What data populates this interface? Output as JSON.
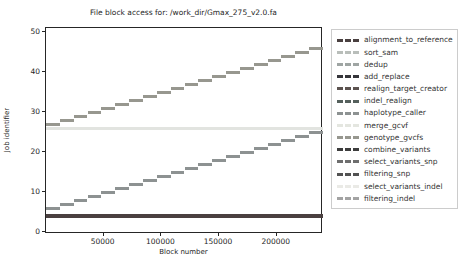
{
  "chart_data": {
    "type": "line",
    "title": "File block access for: /work_dir/Gmax_275_v2.0.fa",
    "xlabel": "Block number",
    "ylabel": "Job identifier",
    "xlim": [
      0,
      240000
    ],
    "ylim": [
      -0.5,
      51
    ],
    "x_ticks": [
      50000,
      100000,
      150000,
      200000
    ],
    "y_ticks": [
      0,
      10,
      20,
      30,
      40,
      50
    ],
    "grid": false,
    "legend_position": "right-outside",
    "series": [
      {
        "name": "alignment_to_reference",
        "color": "#4a4040",
        "segments": [
          {
            "x0": 0,
            "x1": 240000,
            "y": 4,
            "lw": 4
          }
        ]
      },
      {
        "name": "merge_gcvf",
        "color": "#e2e4e0",
        "segments": [
          {
            "x0": 0,
            "x1": 240000,
            "y": 26,
            "lw": 3
          }
        ]
      },
      {
        "name": "haplotype_caller",
        "color": "#8d9292",
        "segments": [
          {
            "x0": 0,
            "x1": 12000,
            "y": 6,
            "lw": 3
          },
          {
            "x0": 12000,
            "x1": 24000,
            "y": 7,
            "lw": 3
          },
          {
            "x0": 24000,
            "x1": 36000,
            "y": 8,
            "lw": 3
          },
          {
            "x0": 36000,
            "x1": 48000,
            "y": 9,
            "lw": 3
          },
          {
            "x0": 48000,
            "x1": 60000,
            "y": 10,
            "lw": 3
          },
          {
            "x0": 60000,
            "x1": 72000,
            "y": 11,
            "lw": 3
          },
          {
            "x0": 72000,
            "x1": 84000,
            "y": 12,
            "lw": 3
          },
          {
            "x0": 84000,
            "x1": 96000,
            "y": 13,
            "lw": 3
          },
          {
            "x0": 96000,
            "x1": 108000,
            "y": 14,
            "lw": 3
          },
          {
            "x0": 108000,
            "x1": 120000,
            "y": 15,
            "lw": 3
          },
          {
            "x0": 120000,
            "x1": 132000,
            "y": 16,
            "lw": 3
          },
          {
            "x0": 132000,
            "x1": 144000,
            "y": 17,
            "lw": 3
          },
          {
            "x0": 144000,
            "x1": 156000,
            "y": 18,
            "lw": 3
          },
          {
            "x0": 156000,
            "x1": 168000,
            "y": 19,
            "lw": 3
          },
          {
            "x0": 168000,
            "x1": 180000,
            "y": 20,
            "lw": 3
          },
          {
            "x0": 180000,
            "x1": 192000,
            "y": 21,
            "lw": 3
          },
          {
            "x0": 192000,
            "x1": 204000,
            "y": 22,
            "lw": 3
          },
          {
            "x0": 204000,
            "x1": 216000,
            "y": 23,
            "lw": 3
          },
          {
            "x0": 216000,
            "x1": 228000,
            "y": 24,
            "lw": 3
          },
          {
            "x0": 228000,
            "x1": 240000,
            "y": 25,
            "lw": 3
          }
        ]
      },
      {
        "name": "genotype_gvcfs",
        "color": "#97978f",
        "segments": [
          {
            "x0": 0,
            "x1": 12000,
            "y": 27,
            "lw": 3
          },
          {
            "x0": 12000,
            "x1": 24000,
            "y": 28,
            "lw": 3
          },
          {
            "x0": 24000,
            "x1": 36000,
            "y": 29,
            "lw": 3
          },
          {
            "x0": 36000,
            "x1": 48000,
            "y": 30,
            "lw": 3
          },
          {
            "x0": 48000,
            "x1": 60000,
            "y": 31,
            "lw": 3
          },
          {
            "x0": 60000,
            "x1": 72000,
            "y": 32,
            "lw": 3
          },
          {
            "x0": 72000,
            "x1": 84000,
            "y": 33,
            "lw": 3
          },
          {
            "x0": 84000,
            "x1": 96000,
            "y": 34,
            "lw": 3
          },
          {
            "x0": 96000,
            "x1": 108000,
            "y": 35,
            "lw": 3
          },
          {
            "x0": 108000,
            "x1": 120000,
            "y": 36,
            "lw": 3
          },
          {
            "x0": 120000,
            "x1": 132000,
            "y": 37,
            "lw": 3
          },
          {
            "x0": 132000,
            "x1": 144000,
            "y": 38,
            "lw": 3
          },
          {
            "x0": 144000,
            "x1": 156000,
            "y": 39,
            "lw": 3
          },
          {
            "x0": 156000,
            "x1": 168000,
            "y": 40,
            "lw": 3
          },
          {
            "x0": 168000,
            "x1": 180000,
            "y": 41,
            "lw": 3
          },
          {
            "x0": 180000,
            "x1": 192000,
            "y": 42,
            "lw": 3
          },
          {
            "x0": 192000,
            "x1": 204000,
            "y": 43,
            "lw": 3
          },
          {
            "x0": 204000,
            "x1": 216000,
            "y": 44,
            "lw": 3
          },
          {
            "x0": 216000,
            "x1": 228000,
            "y": 45,
            "lw": 3
          },
          {
            "x0": 228000,
            "x1": 240000,
            "y": 46,
            "lw": 3
          }
        ]
      }
    ],
    "legend": [
      {
        "label": "alignment_to_reference",
        "color": "#4a4040"
      },
      {
        "label": "sort_sam",
        "color": "#b9beba"
      },
      {
        "label": "dedup",
        "color": "#9fa5a3"
      },
      {
        "label": "add_replace",
        "color": "#35353a"
      },
      {
        "label": "realign_target_creator",
        "color": "#5c5350"
      },
      {
        "label": "indel_realign",
        "color": "#55605c"
      },
      {
        "label": "haplotype_caller",
        "color": "#8d9292"
      },
      {
        "label": "merge_gcvf",
        "color": "#e4e6e0"
      },
      {
        "label": "genotype_gvcfs",
        "color": "#97978f"
      },
      {
        "label": "combine_variants",
        "color": "#3d3d3d"
      },
      {
        "label": "select_variants_snp",
        "color": "#6e6e6e"
      },
      {
        "label": "filtering_snp",
        "color": "#525252"
      },
      {
        "label": "select_variants_indel",
        "color": "#eaeae6"
      },
      {
        "label": "filtering_indel",
        "color": "#a3a3a3"
      }
    ]
  }
}
